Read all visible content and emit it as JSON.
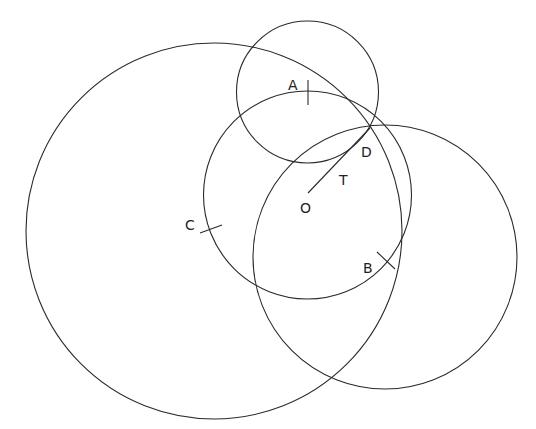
{
  "diagram": {
    "type": "geometry-construction",
    "background": "#ffffff",
    "stroke_color": "#2a2a2a",
    "circles": [
      {
        "id": "small-top-circle",
        "cx": 307.5,
        "cy": 92,
        "r": 71
      },
      {
        "id": "center-O-circle",
        "cx": 307.5,
        "cy": 195,
        "r": 104
      },
      {
        "id": "large-left-circle",
        "cx": 214,
        "cy": 231,
        "r": 188
      },
      {
        "id": "right-circle",
        "cx": 385,
        "cy": 257,
        "r": 132
      }
    ],
    "segments": [
      {
        "id": "segment-OD",
        "from": "O",
        "to": "D"
      }
    ],
    "points": {
      "A": {
        "label": "A",
        "x": 293,
        "y": 88
      },
      "B": {
        "label": "B",
        "x": 370,
        "y": 268
      },
      "C": {
        "label": "C",
        "x": 191,
        "y": 226
      },
      "D": {
        "label": "D",
        "x": 368,
        "y": 157
      },
      "O": {
        "label": "O",
        "x": 307,
        "y": 213
      },
      "T": {
        "label": "T",
        "x": 345,
        "y": 184
      }
    }
  }
}
